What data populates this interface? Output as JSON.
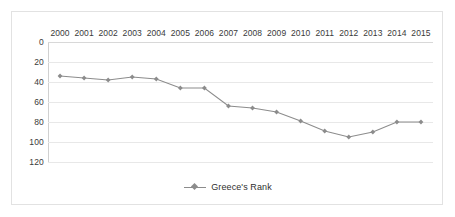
{
  "chart_data": {
    "type": "line",
    "title": "",
    "subtitle": "",
    "xlabel": "",
    "ylabel": "",
    "categories": [
      "2000",
      "2001",
      "2002",
      "2003",
      "2004",
      "2005",
      "2006",
      "2007",
      "2008",
      "2009",
      "2010",
      "2011",
      "2012",
      "2013",
      "2014",
      "2015"
    ],
    "series": [
      {
        "name": "Greece's Rank",
        "color": "#8c8c8c",
        "marker": "diamond",
        "values": [
          34,
          36,
          38,
          35,
          37,
          46,
          46,
          64,
          66,
          70,
          79,
          89,
          95,
          90,
          80,
          80
        ]
      }
    ],
    "ylim": [
      0,
      120
    ],
    "y_inverted": true,
    "y_ticks": [
      "0",
      "20",
      "40",
      "60",
      "80",
      "100",
      "120"
    ],
    "y_tick_values": [
      0,
      20,
      40,
      60,
      80,
      100,
      120
    ],
    "grid": true,
    "x_axis_position": "top",
    "legend": {
      "position": "bottom",
      "entries": [
        "Greece's Rank"
      ]
    }
  },
  "legend": {
    "label": "Greece's Rank"
  },
  "colors": {
    "series": "#8c8c8c",
    "grid": "#e8e8e8",
    "frame": "#e2e2e2",
    "text": "#3a3a3a"
  }
}
